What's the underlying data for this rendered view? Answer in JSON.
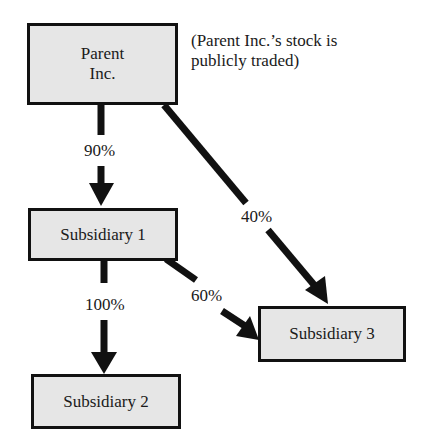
{
  "nodes": {
    "parent": {
      "line1": "Parent",
      "line2": "Inc."
    },
    "sub1": {
      "label": "Subsidiary 1"
    },
    "sub2": {
      "label": "Subsidiary 2"
    },
    "sub3": {
      "label": "Subsidiary 3"
    }
  },
  "note": {
    "line1": "(Parent Inc.’s stock is",
    "line2": "publicly traded)"
  },
  "edges": [
    {
      "from": "Parent Inc.",
      "to": "Subsidiary 1",
      "label": "90%"
    },
    {
      "from": "Parent Inc.",
      "to": "Subsidiary 3",
      "label": "40%"
    },
    {
      "from": "Subsidiary 1",
      "to": "Subsidiary 2",
      "label": "100%"
    },
    {
      "from": "Subsidiary 1",
      "to": "Subsidiary 3",
      "label": "60%"
    }
  ],
  "colors": {
    "box_fill": "#e6e6e6",
    "stroke": "#111111"
  }
}
